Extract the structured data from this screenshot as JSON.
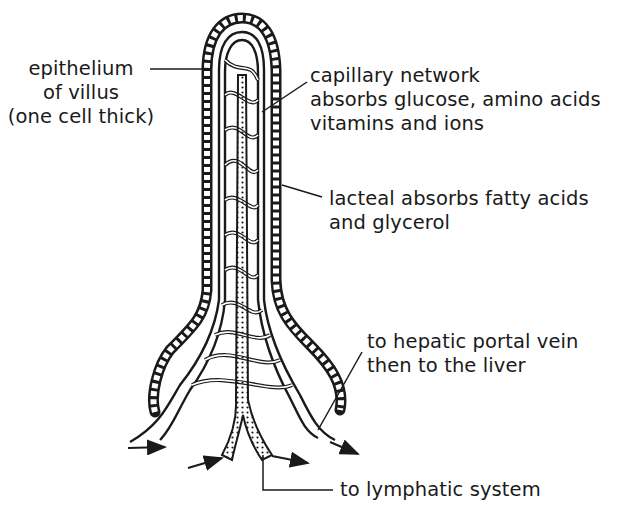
{
  "diagram": {
    "subject": "villus",
    "labels": {
      "epithelium": {
        "lines": [
          "epithelium",
          "of villus",
          "(one cell thick)"
        ]
      },
      "capillary": {
        "lines": [
          "capillary network",
          "absorbs glucose, amino acids",
          "vitamins and ions"
        ]
      },
      "lacteal": {
        "lines": [
          "lacteal absorbs fatty acids",
          "and glycerol"
        ]
      },
      "hepatic": {
        "lines": [
          "to hepatic portal vein",
          "then to the liver"
        ]
      },
      "lymphatic": {
        "lines": [
          "to lymphatic system"
        ]
      }
    },
    "colors": {
      "ink": "#1a1a1a",
      "background": "#ffffff"
    }
  }
}
